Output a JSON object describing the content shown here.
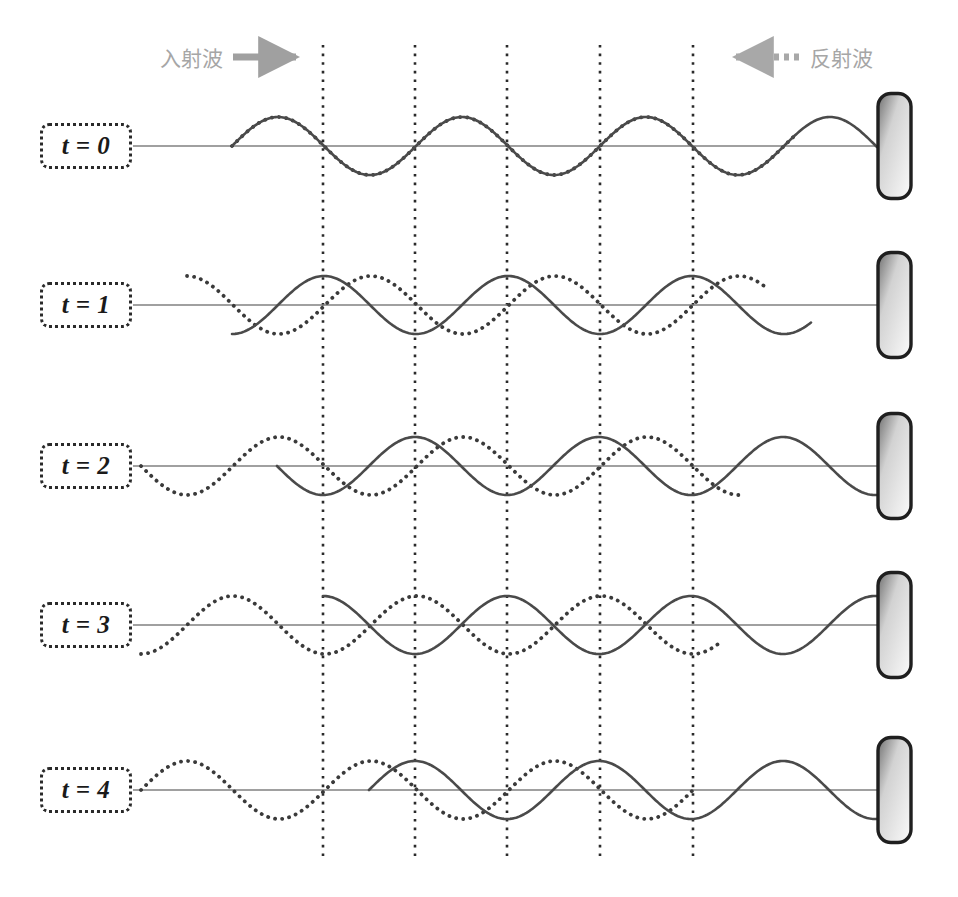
{
  "figure": {
    "width": 958,
    "height": 897,
    "background": "#ffffff"
  },
  "legend": {
    "incident": {
      "label": "入射波",
      "arrow_direction": "right",
      "arrow_style": "solid",
      "arrow_icon": "arrow-right-icon",
      "color": "#a0a0a0"
    },
    "reflected": {
      "label": "反射波",
      "arrow_direction": "left",
      "arrow_style": "dotted",
      "arrow_icon": "arrow-left-dotted-icon",
      "color": "#a8a8a8"
    }
  },
  "axes": {
    "baseline_color": "#808080",
    "baseline_x_start": 133,
    "baseline_x_end": 878,
    "gridline_color": "#2a2a2a",
    "gridline_style": "dotted",
    "gridline_x": [
      323,
      415,
      507,
      600,
      693
    ],
    "gridline_y_top": 45,
    "gridline_y_bottom": 862
  },
  "wall": {
    "name": "reflecting-wall",
    "x": 878,
    "width": 33,
    "height": 105,
    "corner_radius": 13,
    "border_color": "#1f1f1f",
    "gradient_from": "#6f6f6f",
    "gradient_to": "#fbfbfb"
  },
  "wave_style": {
    "incident_color": "#4a4a4a",
    "incident_dash": "solid",
    "reflected_color": "#3a3a3a",
    "reflected_dash": "dotted",
    "stroke_width": 2.6,
    "amplitude": 29,
    "wavelength": 184,
    "half_wavelength": 92
  },
  "rows": [
    {
      "id": "t0",
      "label": "t = 0",
      "baseline_y": 146,
      "phase_note": "in phase — constructive, curves coincide",
      "incident": {
        "x_start": 232,
        "x_end": 878,
        "phase_deg": 0
      },
      "reflected": {
        "x_start": 232,
        "x_end": 795,
        "phase_deg": 0
      }
    },
    {
      "id": "t1",
      "label": "t = 1",
      "baseline_y": 305,
      "phase_note": "quarter-wavelength apart",
      "incident": {
        "x_start": 232,
        "x_end": 812,
        "phase_deg": -90
      },
      "reflected": {
        "x_start": 187,
        "x_end": 766,
        "phase_deg": 90
      }
    },
    {
      "id": "t2",
      "label": "t = 2",
      "baseline_y": 466,
      "phase_note": "exactly out of phase — destructive, mirror images",
      "incident": {
        "x_start": 277,
        "x_end": 878,
        "phase_deg": -180
      },
      "reflected": {
        "x_start": 141,
        "x_end": 740,
        "phase_deg": 180
      }
    },
    {
      "id": "t3",
      "label": "t = 3",
      "baseline_y": 625,
      "phase_note": "three-quarter wavelength apart",
      "incident": {
        "x_start": 323,
        "x_end": 878,
        "phase_deg": -270
      },
      "reflected": {
        "x_start": 141,
        "x_end": 720,
        "phase_deg": 270
      }
    },
    {
      "id": "t4",
      "label": "t = 4",
      "baseline_y": 790,
      "phase_note": "back in phase — curves coincide again",
      "incident": {
        "x_start": 369,
        "x_end": 878,
        "phase_deg": -360
      },
      "reflected": {
        "x_start": 141,
        "x_end": 694,
        "phase_deg": 360
      }
    }
  ],
  "chart_data": {
    "type": "line",
    "xlabel": "",
    "ylabel": "",
    "grid": true,
    "legend_position": "top",
    "series": [
      {
        "name": "入射波",
        "style": "solid",
        "direction": "right"
      },
      {
        "name": "反射波",
        "style": "dotted",
        "direction": "left"
      }
    ],
    "node_positions": [
      323,
      415,
      507,
      600,
      693
    ],
    "time_steps": [
      "t = 0",
      "t = 1",
      "t = 2",
      "t = 3",
      "t = 4"
    ]
  }
}
